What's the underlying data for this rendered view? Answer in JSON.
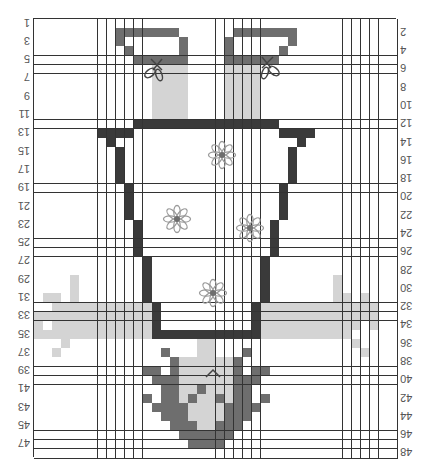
{
  "chart_title": "Knitting/crochet chart (rotated 180°)",
  "colors": {
    "background": "#ffffff",
    "grid_line": "#333333",
    "dark": "#3a3a3a",
    "medium": "#6e6e6e",
    "light": "#d4d4d4",
    "flower_outline": "#9a9a9a",
    "flower_center": "#6e6e6e",
    "bow": "#444444",
    "label": "#555555"
  },
  "grid": {
    "columns": 40,
    "rows": 48,
    "left_labels": [
      "1",
      "3",
      "5",
      "7",
      "9",
      "11",
      "13",
      "15",
      "17",
      "19",
      "21",
      "23",
      "25",
      "27",
      "29",
      "31",
      "33",
      "35",
      "37",
      "39",
      "41",
      "43",
      "45",
      "47"
    ],
    "right_labels": [
      "2",
      "4",
      "6",
      "8",
      "10",
      "12",
      "14",
      "16",
      "18",
      "20",
      "22",
      "24",
      "26",
      "28",
      "30",
      "32",
      "34",
      "36",
      "38",
      "40",
      "42",
      "44",
      "46",
      "48"
    ]
  },
  "chart_data": {
    "type": "heatmap",
    "title": "",
    "rows": 48,
    "columns": 40,
    "legend": [],
    "fills": [
      {
        "tone": "medium",
        "row": 2,
        "cols": [
          10,
          11,
          12,
          13,
          14,
          15,
          16
        ]
      },
      {
        "tone": "medium",
        "row": 3,
        "cols": [
          10,
          17
        ]
      },
      {
        "tone": "medium",
        "row": 4,
        "cols": [
          11,
          17
        ]
      },
      {
        "tone": "medium",
        "row": 5,
        "cols": [
          12,
          13,
          14,
          15,
          16,
          17
        ]
      },
      {
        "tone": "light",
        "row": 6,
        "cols": [
          14,
          15,
          16,
          17
        ]
      },
      {
        "tone": "light",
        "row": 7,
        "cols": [
          14,
          15,
          16,
          17
        ]
      },
      {
        "tone": "light",
        "row": 8,
        "cols": [
          14,
          15,
          16,
          17
        ]
      },
      {
        "tone": "light",
        "row": 9,
        "cols": [
          14,
          15,
          16,
          17
        ]
      },
      {
        "tone": "light",
        "row": 10,
        "cols": [
          14,
          15,
          16,
          17
        ]
      },
      {
        "tone": "light",
        "row": 11,
        "cols": [
          14,
          15,
          16,
          17
        ]
      },
      {
        "tone": "medium",
        "row": 2,
        "cols": [
          23,
          24,
          25,
          26,
          27,
          28,
          29
        ]
      },
      {
        "tone": "medium",
        "row": 3,
        "cols": [
          22,
          29
        ]
      },
      {
        "tone": "medium",
        "row": 4,
        "cols": [
          22,
          28
        ]
      },
      {
        "tone": "medium",
        "row": 5,
        "cols": [
          22,
          23,
          24,
          25,
          26,
          27
        ]
      },
      {
        "tone": "light",
        "row": 6,
        "cols": [
          22,
          23,
          24,
          25
        ]
      },
      {
        "tone": "light",
        "row": 7,
        "cols": [
          22,
          23,
          24,
          25
        ]
      },
      {
        "tone": "light",
        "row": 8,
        "cols": [
          22,
          23,
          24,
          25
        ]
      },
      {
        "tone": "light",
        "row": 9,
        "cols": [
          22,
          23,
          24,
          25
        ]
      },
      {
        "tone": "light",
        "row": 10,
        "cols": [
          22,
          23,
          24,
          25
        ]
      },
      {
        "tone": "light",
        "row": 11,
        "cols": [
          22,
          23,
          24,
          25
        ]
      },
      {
        "tone": "dark",
        "row": 12,
        "cols": [
          12,
          13,
          14,
          15,
          16,
          17,
          18,
          19,
          20,
          21,
          22,
          23,
          24,
          25,
          26,
          27
        ]
      },
      {
        "tone": "dark",
        "row": 13,
        "cols": [
          8,
          9,
          10,
          11,
          28,
          29,
          30,
          31
        ]
      },
      {
        "tone": "dark",
        "row": 14,
        "cols": [
          9,
          30
        ]
      },
      {
        "tone": "dark",
        "row": 15,
        "cols": [
          10,
          29
        ]
      },
      {
        "tone": "dark",
        "row": 16,
        "cols": [
          10,
          29
        ]
      },
      {
        "tone": "dark",
        "row": 17,
        "cols": [
          10,
          29
        ]
      },
      {
        "tone": "dark",
        "row": 18,
        "cols": [
          10,
          29
        ]
      },
      {
        "tone": "dark",
        "row": 19,
        "cols": [
          11,
          28
        ]
      },
      {
        "tone": "dark",
        "row": 20,
        "cols": [
          11,
          28
        ]
      },
      {
        "tone": "dark",
        "row": 21,
        "cols": [
          11,
          28
        ]
      },
      {
        "tone": "dark",
        "row": 22,
        "cols": [
          11,
          28
        ]
      },
      {
        "tone": "dark",
        "row": 23,
        "cols": [
          12,
          27
        ]
      },
      {
        "tone": "dark",
        "row": 24,
        "cols": [
          12,
          27
        ]
      },
      {
        "tone": "dark",
        "row": 25,
        "cols": [
          12,
          27
        ]
      },
      {
        "tone": "dark",
        "row": 26,
        "cols": [
          12,
          27
        ]
      },
      {
        "tone": "dark",
        "row": 27,
        "cols": [
          13,
          26
        ]
      },
      {
        "tone": "dark",
        "row": 28,
        "cols": [
          13,
          26
        ]
      },
      {
        "tone": "dark",
        "row": 29,
        "cols": [
          13,
          26
        ]
      },
      {
        "tone": "dark",
        "row": 30,
        "cols": [
          13,
          26
        ]
      },
      {
        "tone": "dark",
        "row": 31,
        "cols": [
          13,
          26
        ]
      },
      {
        "tone": "dark",
        "row": 32,
        "cols": [
          14,
          25
        ]
      },
      {
        "tone": "dark",
        "row": 33,
        "cols": [
          14,
          25
        ]
      },
      {
        "tone": "dark",
        "row": 34,
        "cols": [
          14,
          25
        ]
      },
      {
        "tone": "dark",
        "row": 35,
        "cols": [
          14,
          15,
          16,
          17,
          18,
          19,
          20,
          21,
          22,
          23,
          24,
          25
        ]
      },
      {
        "tone": "light",
        "row": 29,
        "cols": [
          5,
          34
        ]
      },
      {
        "tone": "light",
        "row": 30,
        "cols": [
          5,
          34
        ]
      },
      {
        "tone": "light",
        "row": 31,
        "cols": [
          2,
          3,
          5,
          34,
          35,
          37
        ]
      },
      {
        "tone": "light",
        "row": 32,
        "cols": [
          3,
          4,
          5,
          6,
          7,
          8,
          9,
          10,
          11,
          12,
          13,
          26,
          27,
          28,
          29,
          30,
          31,
          32,
          33,
          34,
          35,
          36,
          37,
          38
        ]
      },
      {
        "tone": "light",
        "row": 33,
        "cols": [
          1,
          2,
          3,
          4,
          5,
          6,
          7,
          8,
          9,
          10,
          11,
          12,
          13,
          26,
          27,
          28,
          29,
          30,
          31,
          32,
          33,
          34,
          35,
          36,
          37,
          38
        ]
      },
      {
        "tone": "light",
        "row": 34,
        "cols": [
          1,
          3,
          4,
          5,
          6,
          7,
          8,
          9,
          10,
          11,
          12,
          13,
          26,
          27,
          28,
          29,
          30,
          31,
          32,
          33,
          34,
          35,
          36,
          38
        ]
      },
      {
        "tone": "light",
        "row": 35,
        "cols": [
          1,
          2,
          3,
          4,
          5,
          6,
          7,
          8,
          9,
          10,
          11,
          12,
          13,
          26,
          27,
          28,
          29,
          30,
          31,
          32,
          33,
          34,
          35
        ]
      },
      {
        "tone": "light",
        "row": 36,
        "cols": [
          4,
          36
        ]
      },
      {
        "tone": "light",
        "row": 37,
        "cols": [
          3,
          37
        ]
      },
      {
        "tone": "light",
        "row": 36,
        "cols": [
          19,
          20
        ]
      },
      {
        "tone": "medium",
        "row": 37,
        "cols": [
          15,
          24
        ]
      },
      {
        "tone": "light",
        "row": 37,
        "cols": [
          19,
          20
        ]
      },
      {
        "tone": "medium",
        "row": 38,
        "cols": [
          16,
          23
        ]
      },
      {
        "tone": "light",
        "row": 38,
        "cols": [
          17,
          18,
          19,
          20,
          21,
          22
        ]
      },
      {
        "tone": "medium",
        "row": 39,
        "cols": [
          13,
          14,
          16,
          23,
          25,
          26
        ]
      },
      {
        "tone": "light",
        "row": 39,
        "cols": [
          17,
          18,
          19,
          20,
          21,
          22
        ]
      },
      {
        "tone": "medium",
        "row": 40,
        "cols": [
          14,
          15,
          16,
          23,
          24,
          25
        ]
      },
      {
        "tone": "light",
        "row": 40,
        "cols": [
          17,
          18,
          19,
          20,
          21,
          22
        ]
      },
      {
        "tone": "medium",
        "row": 41,
        "cols": [
          15,
          16,
          19,
          23,
          24
        ]
      },
      {
        "tone": "light",
        "row": 41,
        "cols": [
          17,
          18,
          20,
          21,
          22
        ]
      },
      {
        "tone": "medium",
        "row": 42,
        "cols": [
          13,
          15,
          16,
          18,
          21,
          23,
          24,
          26
        ]
      },
      {
        "tone": "light",
        "row": 42,
        "cols": [
          17,
          19,
          20,
          22
        ]
      },
      {
        "tone": "medium",
        "row": 43,
        "cols": [
          14,
          15,
          16,
          17,
          22,
          23,
          24,
          25
        ]
      },
      {
        "tone": "light",
        "row": 43,
        "cols": [
          18,
          19,
          20,
          21
        ]
      },
      {
        "tone": "medium",
        "row": 44,
        "cols": [
          15,
          16,
          17,
          22,
          23,
          24
        ]
      },
      {
        "tone": "light",
        "row": 44,
        "cols": [
          18,
          19,
          20,
          21
        ]
      },
      {
        "tone": "medium",
        "row": 45,
        "cols": [
          16,
          17,
          18,
          21,
          22,
          23
        ]
      },
      {
        "tone": "light",
        "row": 45,
        "cols": [
          19,
          20
        ]
      },
      {
        "tone": "medium",
        "row": 46,
        "cols": [
          17,
          18,
          19,
          20,
          21,
          22
        ]
      },
      {
        "tone": "medium",
        "row": 47,
        "cols": [
          18,
          19,
          20,
          21
        ]
      }
    ],
    "symbols": [
      {
        "type": "bow",
        "x": 156,
        "y": 68
      },
      {
        "type": "bow",
        "x": 268,
        "y": 66,
        "mirror": true
      },
      {
        "type": "flower",
        "x": 222,
        "y": 155
      },
      {
        "type": "flower",
        "x": 177,
        "y": 219
      },
      {
        "type": "flower",
        "x": 250,
        "y": 228
      },
      {
        "type": "flower",
        "x": 213,
        "y": 293
      },
      {
        "type": "chevron",
        "x": 213,
        "y": 373
      }
    ]
  }
}
